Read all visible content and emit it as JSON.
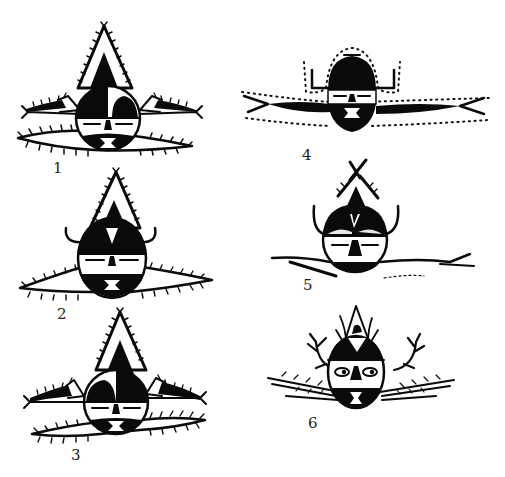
{
  "plate": {
    "description": "Six mask/face motif drawings in black ink, numbered 1-6",
    "ink_color": "#0a0a0a",
    "background": "#ffffff"
  },
  "figures": [
    {
      "id": 1,
      "label": "1",
      "features": [
        "hatched triangular crest",
        "split black/white dome",
        "two side fish/birds",
        "hatched lower wings",
        "closed eyes",
        "hourglass mouth"
      ]
    },
    {
      "id": 2,
      "label": "2",
      "features": [
        "hatched triangular crest",
        "triangle-marked dome",
        "curled horns",
        "hatched lower wings",
        "closed eyes",
        "hourglass mouth"
      ]
    },
    {
      "id": 3,
      "label": "3",
      "features": [
        "hatched triangular crest",
        "split black/white dome",
        "two side fish/birds",
        "hatched lower wings",
        "closed eyes",
        "hourglass mouth"
      ]
    },
    {
      "id": 4,
      "label": "4",
      "features": [
        "dotted outline",
        "black dome",
        "angular horns",
        "crossing long arms",
        "closed eyes",
        "bowtie mouth"
      ]
    },
    {
      "id": 5,
      "label": "5",
      "features": [
        "crossed antenna crest",
        "V-marked dome",
        "curved horns",
        "rough lower arms",
        "closed eyes"
      ]
    },
    {
      "id": 6,
      "label": "6",
      "features": [
        "flame crest",
        "triangle-marked dome",
        "antler horns",
        "open eyes",
        "hatched branches",
        "hourglass mouth"
      ]
    }
  ]
}
